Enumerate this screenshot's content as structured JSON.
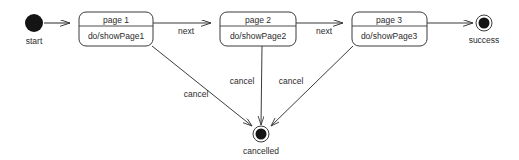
{
  "diagram": {
    "type": "uml-state-machine",
    "title": "",
    "background_color": "#ffffff",
    "line_color": "#3b3b3b",
    "text_color": "#2b2b2b",
    "nodes": [
      {
        "id": "start",
        "kind": "initial-state",
        "label": "start",
        "cx": 34,
        "cy": 23,
        "r": 9,
        "fill": "#141414"
      },
      {
        "id": "page1",
        "kind": "state",
        "name": "page 1",
        "activity": "do/showPage1",
        "x": 79,
        "y": 12,
        "w": 74,
        "h": 34,
        "divider_y": 26
      },
      {
        "id": "page2",
        "kind": "state",
        "name": "page 2",
        "activity": "do/showPage2",
        "x": 220,
        "y": 12,
        "w": 76,
        "h": 34,
        "divider_y": 26
      },
      {
        "id": "page3",
        "kind": "state",
        "name": "page 3",
        "activity": "do/showPage3",
        "x": 352,
        "y": 12,
        "w": 75,
        "h": 34,
        "divider_y": 26
      },
      {
        "id": "success",
        "kind": "final-state",
        "label": "success",
        "cx": 484,
        "cy": 23,
        "r_outer": 8,
        "r_inner": 5.5,
        "fill": "#141414"
      },
      {
        "id": "cancelled",
        "kind": "final-state",
        "label": "cancelled",
        "cx": 261,
        "cy": 134,
        "r_outer": 8,
        "r_inner": 5.5,
        "fill": "#141414"
      }
    ],
    "transitions": [
      {
        "id": "t-start-page1",
        "from": "start",
        "to": "page1",
        "label": ""
      },
      {
        "id": "t-page1-page2",
        "from": "page1",
        "to": "page2",
        "label": "next",
        "label_x": 186,
        "label_y": 34
      },
      {
        "id": "t-page2-page3",
        "from": "page2",
        "to": "page3",
        "label": "next",
        "label_x": 324,
        "label_y": 34
      },
      {
        "id": "t-page3-success",
        "from": "page3",
        "to": "success",
        "label": ""
      },
      {
        "id": "t-page1-cancelled",
        "from": "page1",
        "to": "cancelled",
        "label": "cancel",
        "label_x": 196,
        "label_y": 97
      },
      {
        "id": "t-page2-cancelled",
        "from": "page2",
        "to": "cancelled",
        "label": "cancel",
        "label_x": 242,
        "label_y": 84
      },
      {
        "id": "t-page3-cancelled",
        "from": "page3",
        "to": "cancelled",
        "label": "cancel",
        "label_x": 291,
        "label_y": 84
      }
    ]
  }
}
